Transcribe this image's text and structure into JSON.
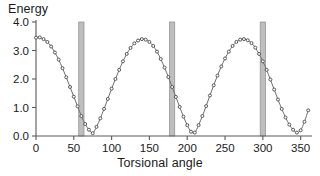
{
  "chart_data": {
    "type": "line",
    "title": "",
    "xlabel": "Torsional angle",
    "ylabel": "Energy",
    "xlim": [
      0,
      365
    ],
    "ylim": [
      0,
      4.0
    ],
    "grid": false,
    "legend": "none",
    "xticks": [
      "0",
      "50",
      "100",
      "150",
      "200",
      "250",
      "300",
      "350"
    ],
    "xtick_values": [
      0,
      50,
      100,
      150,
      200,
      250,
      300,
      350
    ],
    "yticks": [
      "0.0",
      "1.0",
      "2.0",
      "3.0",
      "4.0"
    ],
    "ytick_values": [
      0.0,
      1.0,
      2.0,
      3.0,
      4.0
    ],
    "marker": "open-circle",
    "series": [
      {
        "name": "Torsional energy",
        "x": [
          0,
          5,
          10,
          15,
          20,
          25,
          30,
          35,
          40,
          45,
          50,
          55,
          60,
          65,
          70,
          75,
          80,
          85,
          90,
          95,
          100,
          105,
          110,
          115,
          120,
          125,
          130,
          135,
          140,
          145,
          150,
          155,
          160,
          165,
          170,
          175,
          180,
          185,
          190,
          195,
          200,
          205,
          210,
          215,
          220,
          225,
          230,
          235,
          240,
          245,
          250,
          255,
          260,
          265,
          270,
          275,
          280,
          285,
          290,
          295,
          300,
          305,
          310,
          315,
          320,
          325,
          330,
          335,
          340,
          345,
          350,
          355,
          360
        ],
        "y": [
          3.45,
          3.46,
          3.4,
          3.3,
          3.14,
          2.93,
          2.68,
          2.38,
          2.06,
          1.72,
          1.38,
          1.04,
          0.7,
          0.42,
          0.22,
          0.1,
          0.32,
          0.62,
          0.95,
          1.3,
          1.66,
          2.0,
          2.32,
          2.62,
          2.88,
          3.09,
          3.25,
          3.35,
          3.4,
          3.38,
          3.3,
          3.16,
          2.96,
          2.7,
          2.4,
          2.07,
          1.72,
          1.37,
          1.02,
          0.68,
          0.38,
          0.15,
          0.12,
          0.38,
          0.7,
          1.05,
          1.42,
          1.78,
          2.12,
          2.44,
          2.72,
          2.96,
          3.16,
          3.3,
          3.38,
          3.4,
          3.36,
          3.26,
          3.1,
          2.88,
          2.62,
          2.32,
          1.98,
          1.63,
          1.28,
          0.95,
          0.65,
          0.4,
          0.22,
          0.12,
          0.2,
          0.5,
          0.9
        ]
      }
    ],
    "barriers": [
      {
        "label": "barrier-60",
        "x_center": 60,
        "x_width": 7,
        "y_top": 4.0,
        "y_bottom": 0.0
      },
      {
        "label": "barrier-180",
        "x_center": 180,
        "x_width": 7,
        "y_top": 4.0,
        "y_bottom": 0.0
      },
      {
        "label": "barrier-300",
        "x_center": 300,
        "x_width": 7,
        "y_top": 4.0,
        "y_bottom": 0.0
      }
    ],
    "colors": {
      "curve": "#6e6e6e",
      "marker_fill": "#ffffff",
      "marker_stroke": "#4a4a4a",
      "axis": "#5a5a5a",
      "barrier": "#b3b3b3",
      "text": "#1a1a1a",
      "background": "#ffffff"
    }
  }
}
